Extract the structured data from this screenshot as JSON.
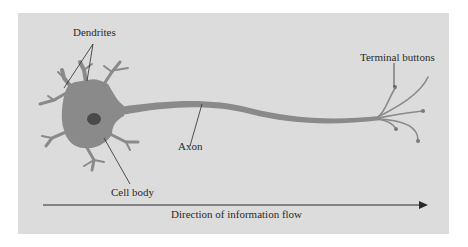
{
  "figure": {
    "labels": {
      "dendrites": "Dendrites",
      "cell_body": "Cell body",
      "axon": "Axon",
      "terminal_buttons": "Terminal buttons",
      "flow": "Direction of information flow"
    },
    "colors": {
      "panel": "#dcdcdc",
      "neuron": "#8a8a8a",
      "nucleus": "#4a4a4a",
      "line": "#2a2a2a"
    }
  }
}
